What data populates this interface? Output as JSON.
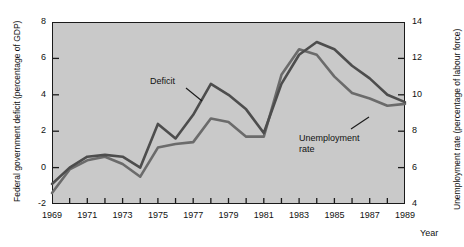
{
  "chart_data": {
    "type": "line",
    "title": "",
    "xlabel": "Year",
    "ylabel": "Federal government deficit (percentage of GDP)",
    "ylabel_right": "Unemployment rate (percentage of labour force)",
    "x": [
      1969,
      1970,
      1971,
      1972,
      1973,
      1974,
      1975,
      1976,
      1977,
      1978,
      1979,
      1980,
      1981,
      1982,
      1983,
      1984,
      1985,
      1986,
      1987,
      1988,
      1989
    ],
    "xlim": [
      1969,
      1989
    ],
    "xticks": [
      1969,
      1970,
      1971,
      1972,
      1973,
      1974,
      1975,
      1976,
      1977,
      1978,
      1979,
      1980,
      1981,
      1982,
      1983,
      1984,
      1985,
      1986,
      1987,
      1988,
      1989
    ],
    "xtick_labels": [
      "1969",
      "",
      "1971",
      "",
      "1973",
      "",
      "1975",
      "",
      "1977",
      "",
      "1979",
      "",
      "1981",
      "",
      "1983",
      "",
      "1985",
      "",
      "1987",
      "",
      "1989"
    ],
    "ylim": [
      -2,
      8
    ],
    "yticks": [
      -2,
      0,
      2,
      4,
      6,
      8
    ],
    "ytick_labels": [
      "-2",
      "0",
      "2",
      "4",
      "6",
      "8"
    ],
    "ylim_right": [
      4,
      14
    ],
    "yticks_right": [
      4,
      6,
      8,
      10,
      12,
      14
    ],
    "ytick_labels_right": [
      "4",
      "6",
      "8",
      "10",
      "12",
      "14"
    ],
    "grid": false,
    "legend": "inline-annotations",
    "plot_background": "#c9c9c9",
    "series": [
      {
        "name": "Deficit",
        "axis": "left",
        "units": "percentage of GDP",
        "color": "#4d4d4d",
        "label_text": "Deficit",
        "values": [
          -0.9,
          0.0,
          0.6,
          0.7,
          0.6,
          0.0,
          2.4,
          1.6,
          2.9,
          4.6,
          4.0,
          3.2,
          1.9,
          4.6,
          6.2,
          6.9,
          6.5,
          5.6,
          4.9,
          4.0,
          3.6
        ]
      },
      {
        "name": "Unemployment rate",
        "axis": "right",
        "units": "percentage of labour force",
        "color": "#6b6b6b",
        "label_text": "Unemployment\nrate",
        "label_line1": "Unemployment",
        "label_line2": "rate",
        "values": [
          4.6,
          5.9,
          6.4,
          6.6,
          6.2,
          5.5,
          7.1,
          7.3,
          7.4,
          8.7,
          8.5,
          7.7,
          7.7,
          11.1,
          12.5,
          12.2,
          11.0,
          10.1,
          9.8,
          9.4,
          9.5
        ]
      }
    ]
  }
}
